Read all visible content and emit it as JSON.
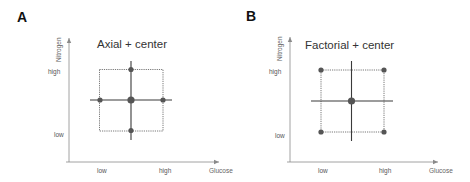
{
  "colors": {
    "axis": "#8a8a8a",
    "cross": "#3a3a3a",
    "box": "#555555",
    "point": "#555555",
    "text": "#333333"
  },
  "panels": [
    {
      "letter": "A",
      "title": "Axial + center",
      "x_axis_label": "Glucose",
      "y_axis_label": "Nitrogen",
      "x_ticks": [
        "low",
        "high"
      ],
      "y_ticks": [
        "high",
        "low"
      ],
      "design_points": [
        {
          "glucose": "center",
          "nitrogen": "high"
        },
        {
          "glucose": "low",
          "nitrogen": "center"
        },
        {
          "glucose": "center",
          "nitrogen": "center",
          "is_center": true
        },
        {
          "glucose": "high",
          "nitrogen": "center"
        },
        {
          "glucose": "center",
          "nitrogen": "low"
        }
      ]
    },
    {
      "letter": "B",
      "title": "Factorial + center",
      "x_axis_label": "Glucose",
      "y_axis_label": "Nitrogen",
      "x_ticks": [
        "low",
        "high"
      ],
      "y_ticks": [
        "high",
        "low"
      ],
      "design_points": [
        {
          "glucose": "low",
          "nitrogen": "high"
        },
        {
          "glucose": "high",
          "nitrogen": "high"
        },
        {
          "glucose": "center",
          "nitrogen": "center",
          "is_center": true
        },
        {
          "glucose": "low",
          "nitrogen": "low"
        },
        {
          "glucose": "high",
          "nitrogen": "low"
        }
      ]
    }
  ]
}
